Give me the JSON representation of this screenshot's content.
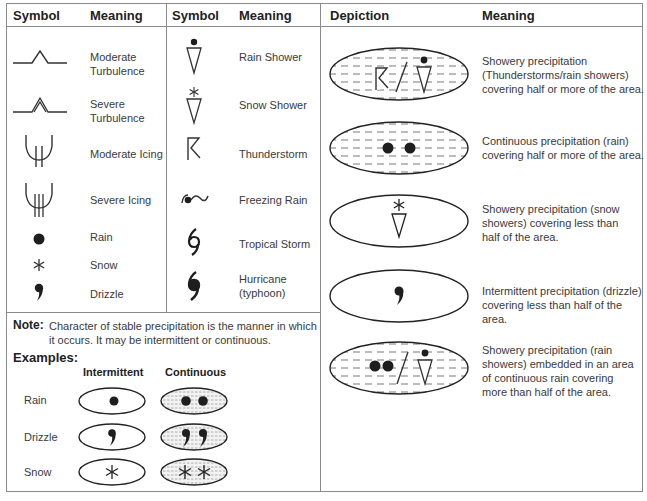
{
  "left_table": {
    "headers": {
      "symbol_1": "Symbol",
      "meaning_1": "Meaning",
      "symbol_2": "Symbol",
      "meaning_2": "Meaning"
    },
    "column_1": [
      {
        "icon": "moderate-turbulence-icon",
        "meaning_line1": "Moderate",
        "meaning_line2": "Turbulence"
      },
      {
        "icon": "severe-turbulence-icon",
        "meaning_line1": "Severe",
        "meaning_line2": "Turbulence"
      },
      {
        "icon": "moderate-icing-icon",
        "meaning": "Moderate Icing"
      },
      {
        "icon": "severe-icing-icon",
        "meaning": "Severe Icing"
      },
      {
        "icon": "rain-dot-icon",
        "meaning": "Rain"
      },
      {
        "icon": "snow-asterisk-icon",
        "meaning": "Snow",
        "glyph": "✻"
      },
      {
        "icon": "drizzle-comma-icon",
        "meaning": "Drizzle",
        "glyph": ","
      }
    ],
    "column_2": [
      {
        "icon": "rain-shower-icon",
        "meaning": "Rain Shower"
      },
      {
        "icon": "snow-shower-icon",
        "meaning": "Snow Shower"
      },
      {
        "icon": "thunderstorm-icon",
        "meaning": "Thunderstorm"
      },
      {
        "icon": "freezing-rain-icon",
        "meaning": "Freezing Rain"
      },
      {
        "icon": "tropical-storm-icon",
        "meaning": "Tropical Storm"
      },
      {
        "icon": "hurricane-icon",
        "meaning_line1": "Hurricane",
        "meaning_line2": "(typhoon)"
      }
    ]
  },
  "note": {
    "label": "Note:",
    "line1": "Character of stable precipitation is the manner in which",
    "line2": "it occurs. It may be intermittent or continuous."
  },
  "examples": {
    "title": "Examples:",
    "col_intermittent": "Intermittent",
    "col_continuous": "Continuous",
    "rows": [
      {
        "label": "Rain",
        "icon": "rain-dot-icon"
      },
      {
        "label": "Drizzle",
        "icon": "drizzle-comma-icon"
      },
      {
        "label": "Snow",
        "icon": "snow-asterisk-icon"
      }
    ]
  },
  "right_table": {
    "headers": {
      "depiction": "Depiction",
      "meaning": "Meaning"
    },
    "rows": [
      {
        "lines": [
          "Showery precipitation",
          "(Thunderstorms/rain showers)",
          "covering half or more of the area."
        ]
      },
      {
        "lines": [
          "Continuous precipitation (rain)",
          "covering half or more of the area."
        ]
      },
      {
        "lines": [
          "Showery precipitation (snow",
          "showers) covering less than",
          "half of the area."
        ]
      },
      {
        "lines": [
          "Intermittent precipitation (drizzle)",
          "covering less than half of the area."
        ]
      },
      {
        "lines": [
          "Showery precipitation (rain",
          "showers) embedded in an area",
          "of continuous rain covering",
          "more than half of the area."
        ]
      }
    ]
  },
  "colors": {
    "line": "#8a8a8a",
    "ink": "#1e1e1e",
    "text": "#3a3a3a"
  }
}
